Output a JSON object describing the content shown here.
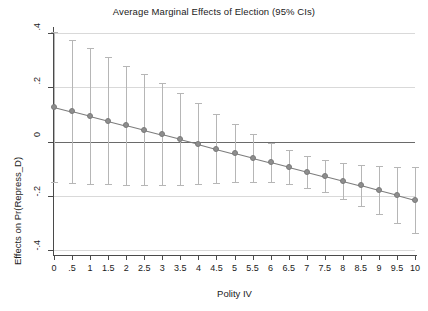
{
  "chart_data": {
    "type": "scatter",
    "title": "Average Marginal Effects of Election (95% CIs)",
    "xlabel": "Polity IV",
    "ylabel": "Effects on Pr(Repress_D)",
    "grid": true,
    "legend": "none",
    "xlim": [
      0,
      10
    ],
    "ylim": [
      -0.4,
      0.4
    ],
    "xticks": [
      "0",
      ".5",
      "1",
      "1.5",
      "2",
      "2.5",
      "3",
      "3.5",
      "4",
      "4.5",
      "5",
      "5.5",
      "6",
      "6.5",
      "7",
      "7.5",
      "8",
      "8.5",
      "9",
      "9.5",
      "10"
    ],
    "xtick_values": [
      0,
      0.5,
      1,
      1.5,
      2,
      2.5,
      3,
      3.5,
      4,
      4.5,
      5,
      5.5,
      6,
      6.5,
      7,
      7.5,
      8,
      8.5,
      9,
      9.5,
      10
    ],
    "yticks": [
      ".4",
      ".2",
      "0",
      "-.2",
      "-.4"
    ],
    "ytick_values": [
      0.4,
      0.2,
      0,
      -0.2,
      -0.4
    ],
    "gridline_values": [
      0.4,
      0.2,
      -0.2,
      -0.4
    ],
    "zero_reference_line": 0,
    "marker_color": "#8e8e8e",
    "ci_color": "#b6b6b6",
    "line_color": "#7c7c7c",
    "x": [
      0,
      0.5,
      1,
      1.5,
      2,
      2.5,
      3,
      3.5,
      4,
      4.5,
      5,
      5.5,
      6,
      6.5,
      7,
      7.5,
      8,
      8.5,
      9,
      9.5,
      10
    ],
    "values": [
      0.128,
      0.111,
      0.094,
      0.077,
      0.06,
      0.043,
      0.026,
      0.009,
      -0.008,
      -0.026,
      -0.043,
      -0.06,
      -0.077,
      -0.094,
      -0.111,
      -0.128,
      -0.145,
      -0.162,
      -0.18,
      -0.197,
      -0.215
    ],
    "ci_lower": [
      -0.148,
      -0.152,
      -0.155,
      -0.158,
      -0.16,
      -0.162,
      -0.162,
      -0.161,
      -0.158,
      -0.154,
      -0.15,
      -0.148,
      -0.15,
      -0.157,
      -0.17,
      -0.188,
      -0.211,
      -0.238,
      -0.268,
      -0.301,
      -0.336
    ],
    "ci_upper": [
      0.404,
      0.374,
      0.343,
      0.312,
      0.28,
      0.248,
      0.214,
      0.179,
      0.142,
      0.102,
      0.064,
      0.028,
      -0.004,
      -0.031,
      -0.052,
      -0.068,
      -0.079,
      -0.086,
      -0.092,
      -0.093,
      -0.094
    ],
    "series": [
      {
        "name": "Average marginal effect of Election",
        "values": [
          0.128,
          0.111,
          0.094,
          0.077,
          0.06,
          0.043,
          0.026,
          0.009,
          -0.008,
          -0.026,
          -0.043,
          -0.06,
          -0.077,
          -0.094,
          -0.111,
          -0.128,
          -0.145,
          -0.162,
          -0.18,
          -0.197,
          -0.215
        ]
      }
    ]
  }
}
